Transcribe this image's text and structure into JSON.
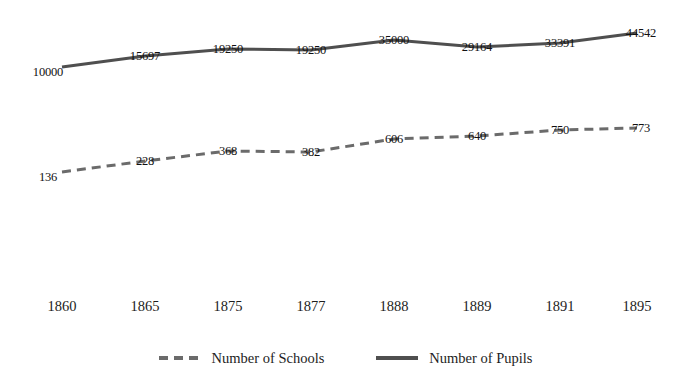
{
  "chart_data": {
    "type": "line",
    "title": "",
    "subtitle": "",
    "xlabel": "",
    "ylabel": "",
    "grid": false,
    "legend_position": "bottom-center",
    "axis_lines": false,
    "categories": [
      "1860",
      "1865",
      "1875",
      "1877",
      "1888",
      "1889",
      "1891",
      "1895"
    ],
    "series": [
      {
        "name": "Number of Schools",
        "style": "dashed",
        "color": "#6b6b6b",
        "values": [
          136,
          228,
          368,
          382,
          606,
          640,
          750,
          773
        ],
        "labels": [
          "136",
          "228",
          "368",
          "382",
          "606",
          "640",
          "750",
          "773"
        ]
      },
      {
        "name": "Number of Pupils",
        "style": "solid",
        "color": "#4f4f4f",
        "values": [
          10000,
          15697,
          19250,
          19250,
          35000,
          29164,
          33391,
          44542
        ],
        "labels": [
          "10000",
          "15697",
          "19250",
          "19250",
          "35000",
          "29164",
          "33391",
          "44542"
        ]
      }
    ]
  },
  "colors": {
    "background": "#ffffff",
    "pupils_line": "#4f4f4f",
    "schools_line": "#6b6b6b",
    "text": "#1a1a1a"
  },
  "legend": {
    "items": [
      {
        "label": "Number of Schools",
        "marker": "dashed-line-icon"
      },
      {
        "label": "Number of Pupils",
        "marker": "solid-line-icon"
      }
    ]
  },
  "geometry": {
    "x_positions": [
      62,
      145,
      228,
      311,
      394,
      477,
      560,
      637
    ],
    "pupils_y": [
      67,
      56,
      49,
      50,
      40,
      47,
      43,
      33
    ],
    "schools_y": [
      172,
      161,
      151,
      152,
      139,
      136,
      130,
      128
    ]
  }
}
